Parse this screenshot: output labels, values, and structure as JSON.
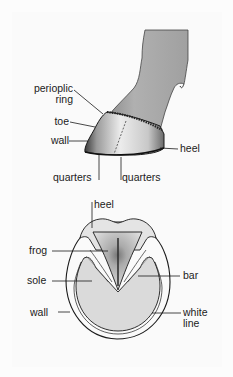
{
  "figure": {
    "side_view": {
      "title": "Horse hoof, side view",
      "labels": {
        "periopic_line1": "perioplic",
        "periopic_line2": "ring",
        "toe": "toe",
        "wall": "wall",
        "heel": "heel",
        "quarters_left": "quarters",
        "quarters_right": "quarters"
      }
    },
    "bottom_view": {
      "title": "Horse hoof, underside view",
      "labels": {
        "heel": "heel",
        "frog": "frog",
        "sole": "sole",
        "wall": "wall",
        "bar": "bar",
        "white_line1": "white",
        "white_line2": "line"
      }
    },
    "colors": {
      "background": "#fcfcfc",
      "leg_fill": "#a8a8a8",
      "hoof_fill": "#e6e6e6",
      "sole_fill": "#dcdcdc",
      "outline": "#1a1a1a"
    }
  }
}
